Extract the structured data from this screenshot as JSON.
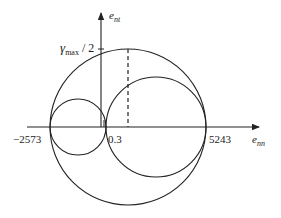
{
  "diagram": {
    "type": "mohr-strain-circles",
    "axes": {
      "x_label": "e",
      "x_label_sub": "nn",
      "y_label": "e",
      "y_label_sub": "nt"
    },
    "y_marker": {
      "symbol": "γ",
      "sub": "max",
      "suffix": " / 2"
    },
    "x_ticks": [
      {
        "label": "−2573",
        "value": -2573
      },
      {
        "label": "0.3",
        "value": 0.3
      },
      {
        "label": "5243",
        "value": 5243
      }
    ],
    "circles": [
      {
        "name": "large",
        "from": -2573,
        "to": 5243
      },
      {
        "name": "small",
        "from": -2573,
        "to": 0.3
      },
      {
        "name": "medium",
        "from": 0.3,
        "to": 5243
      }
    ],
    "colors": {
      "stroke": "#222222",
      "background": "#ffffff"
    }
  }
}
